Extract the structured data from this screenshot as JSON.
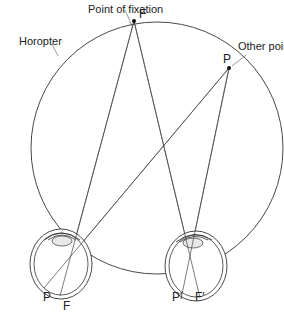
{
  "diagram": {
    "labels": {
      "fixation_callout": "Point of fixation",
      "fixation_point": "F",
      "other_callout": "Other point",
      "other_point": "P",
      "horopter": "Horopter",
      "left_retina_p": "P",
      "left_retina_f": "F",
      "right_retina_p": "P′",
      "right_retina_f": "F′"
    },
    "elements": [
      {
        "type": "circle",
        "name": "horopter-circle"
      },
      {
        "type": "point",
        "name": "fixation-point"
      },
      {
        "type": "point",
        "name": "other-point"
      },
      {
        "type": "eye",
        "name": "left-eye"
      },
      {
        "type": "eye",
        "name": "right-eye"
      }
    ]
  }
}
